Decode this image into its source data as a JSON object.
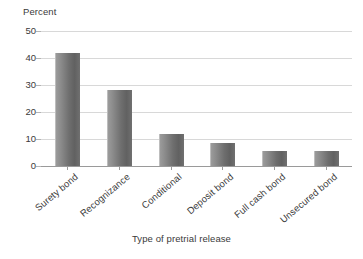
{
  "chart_data": {
    "type": "bar",
    "title": "",
    "subtitle": "",
    "xlabel": "Type of pretrial release",
    "ylabel": "Percent",
    "categories": [
      "Surety bond",
      "Recognizance",
      "Conditional",
      "Deposit bond",
      "Full cash bond",
      "Unsecured bond"
    ],
    "values": [
      42,
      28,
      12,
      8.5,
      5.5,
      5.5
    ],
    "ylim": [
      0,
      50
    ],
    "yticks": [
      0,
      10,
      20,
      30,
      40,
      50
    ],
    "ytick_labels": [
      "0",
      "10",
      "20",
      "30",
      "40",
      "50"
    ],
    "grid": true,
    "grid_axis": "y",
    "legend": false,
    "legend_position": "none",
    "bar_color": "#6e6e6e",
    "bar_color_light": "#9b9b9b",
    "gridline_color": "#d8d8d8",
    "axis_color": "#9a9a9a",
    "text_color": "#3a3a3a",
    "background_color": "#ffffff",
    "xtick_label_rotation": -40
  }
}
